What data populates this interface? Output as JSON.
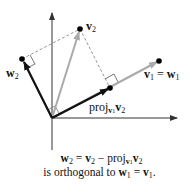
{
  "diagram": {
    "colors": {
      "axis": "#333333",
      "w_vectors": "#111111",
      "v2_vector": "#aaaaaa",
      "v1_vector": "#aaaaaa",
      "dashed": "#999999",
      "point": "#000000"
    },
    "points": {
      "origin": [
        52,
        118
      ],
      "v2": [
        80,
        29
      ],
      "w2": [
        22,
        59
      ],
      "v1": [
        159,
        61
      ],
      "proj": [
        110,
        88
      ]
    },
    "labels": {
      "v2": {
        "base": "v",
        "sub": "2"
      },
      "w2": {
        "base": "w",
        "sub": "2"
      },
      "v1_eq_w1": {
        "left": "v",
        "left_sub": "1",
        "eq": " = ",
        "right": "w",
        "right_sub": "1"
      },
      "proj": {
        "text": "proj",
        "sub_base": "v",
        "sub_sub": "1",
        "arg": "v",
        "arg_sub": "2"
      }
    },
    "caption": {
      "line1": {
        "w": "w",
        "w_sub": "2",
        "eq": " = ",
        "v": "v",
        "v_sub": "2",
        "minus": " − proj",
        "p_sub_v": "v",
        "p_sub_sub": "1",
        "arg": "v",
        "arg_sub": "2"
      },
      "line2": {
        "text": "is orthogonal to ",
        "w": "w",
        "w_sub": "1",
        "eq": " = ",
        "v": "v",
        "v_sub": "1",
        "end": "."
      }
    }
  }
}
